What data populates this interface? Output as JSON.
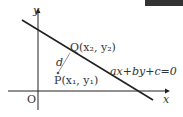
{
  "diagram": {
    "axis_x_label": "x",
    "axis_y_label": "y",
    "origin_label": "O",
    "point_q_label": "Q(x₂, y₂)",
    "point_p_label": "P(x₁, y₁)",
    "distance_label": "d",
    "line_equation": "ax+by+c=0"
  }
}
